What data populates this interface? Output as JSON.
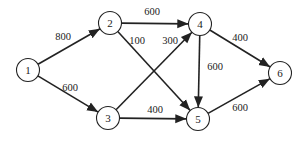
{
  "diagram": {
    "type": "directed-weighted-graph",
    "nodes": [
      {
        "id": "1",
        "label": "1"
      },
      {
        "id": "2",
        "label": "2"
      },
      {
        "id": "3",
        "label": "3"
      },
      {
        "id": "4",
        "label": "4"
      },
      {
        "id": "5",
        "label": "5"
      },
      {
        "id": "6",
        "label": "6"
      }
    ],
    "edges": [
      {
        "from": "1",
        "to": "2",
        "weight": "800"
      },
      {
        "from": "1",
        "to": "3",
        "weight": "600"
      },
      {
        "from": "2",
        "to": "4",
        "weight": "600"
      },
      {
        "from": "2",
        "to": "5",
        "weight": "100"
      },
      {
        "from": "3",
        "to": "4",
        "weight": "300"
      },
      {
        "from": "3",
        "to": "5",
        "weight": "400"
      },
      {
        "from": "4",
        "to": "5",
        "weight": "600"
      },
      {
        "from": "4",
        "to": "6",
        "weight": "400"
      },
      {
        "from": "5",
        "to": "6",
        "weight": "600"
      }
    ]
  }
}
